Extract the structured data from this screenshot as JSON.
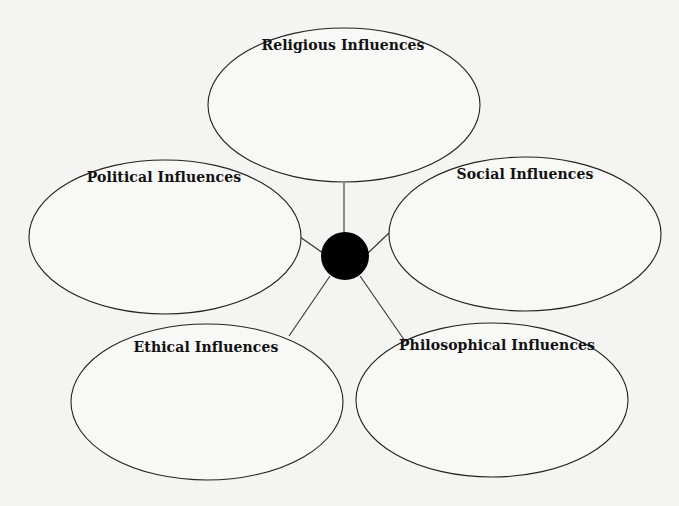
{
  "diagram": {
    "type": "web-organizer",
    "hub": {
      "cx": 345,
      "cy": 256,
      "r": 24,
      "color": "#000000"
    },
    "line_color": "#333333",
    "ellipse_stroke": "#222222",
    "nodes": [
      {
        "id": "religious",
        "label": "Religious Influences",
        "cx": 344,
        "cy": 105,
        "rx": 136,
        "ry": 77,
        "label_x": 343,
        "label_y": 47
      },
      {
        "id": "political",
        "label": "Political Influences",
        "cx": 165,
        "cy": 237,
        "rx": 136,
        "ry": 77,
        "label_x": 164,
        "label_y": 179
      },
      {
        "id": "social",
        "label": "Social Influences",
        "cx": 525,
        "cy": 234,
        "rx": 136,
        "ry": 77,
        "label_x": 525,
        "label_y": 176
      },
      {
        "id": "ethical",
        "label": "Ethical Influences",
        "cx": 207,
        "cy": 402,
        "rx": 136,
        "ry": 78,
        "label_x": 206,
        "label_y": 349
      },
      {
        "id": "philosophical",
        "label": "Philosophical Influences",
        "cx": 492,
        "cy": 400,
        "rx": 136,
        "ry": 77,
        "label_x": 497,
        "label_y": 347
      }
    ],
    "connectors": [
      {
        "to": "religious",
        "x1": 344,
        "y1": 183,
        "x2": 344,
        "y2": 233
      },
      {
        "to": "political",
        "x1": 300,
        "y1": 237,
        "x2": 323,
        "y2": 253
      },
      {
        "to": "social",
        "x1": 389,
        "y1": 233,
        "x2": 368,
        "y2": 253
      },
      {
        "to": "ethical",
        "x1": 330,
        "y1": 276,
        "x2": 289,
        "y2": 336
      },
      {
        "to": "philosophical",
        "x1": 360,
        "y1": 276,
        "x2": 405,
        "y2": 341
      }
    ]
  }
}
